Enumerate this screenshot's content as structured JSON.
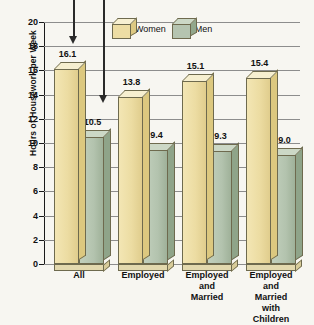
{
  "chart_data": {
    "type": "bar",
    "title": "",
    "xlabel": "",
    "ylabel": "Hours of Housework per Week",
    "ylim": [
      0,
      20
    ],
    "yticks": [
      0,
      2,
      4,
      6,
      8,
      10,
      12,
      14,
      16,
      18,
      20
    ],
    "grid": true,
    "legend_position": "top-center",
    "categories": [
      "All",
      "Employed",
      "Employed and Married",
      "Employed and Married with Children"
    ],
    "category_lines": [
      [
        "All"
      ],
      [
        "Employed"
      ],
      [
        "Employed",
        "and",
        "Married"
      ],
      [
        "Employed",
        "and",
        "Married",
        "with",
        "Children"
      ]
    ],
    "series": [
      {
        "name": "Women",
        "color": "#ecdca2",
        "values": [
          16.1,
          13.8,
          15.1,
          15.4
        ]
      },
      {
        "name": "Men",
        "color": "#b3c3ae",
        "values": [
          10.5,
          9.4,
          9.3,
          9.0
        ]
      }
    ],
    "annotations": [
      {
        "name": "arrow-to-women-bar",
        "target": "Women / All"
      },
      {
        "name": "arrow-to-men-bar",
        "target": "Men / All"
      }
    ]
  },
  "legend": {
    "items": [
      {
        "label": "Women",
        "icon": "cube-swatch-women"
      },
      {
        "label": "Men",
        "icon": "cube-swatch-men"
      }
    ]
  },
  "colors": {
    "women_face": "#ecdca2",
    "women_side": "#dcc87f",
    "women_top": "#f6efd0",
    "men_face": "#b3c3ae",
    "men_side": "#8fa489",
    "men_top": "#ccd8c6",
    "outline": "#6e6a4e",
    "gridline": "#8d8d8d",
    "axis": "#1a1a1a",
    "background": "#f7f6f1",
    "text": "#111111"
  }
}
